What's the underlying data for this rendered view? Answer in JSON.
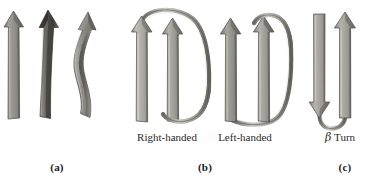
{
  "figure": {
    "background_color": "#ffffff",
    "ink_color": "#1b1b1b"
  },
  "panels": [
    {
      "id": "a",
      "caption": "(a)",
      "caption_x": 57,
      "caption_y": 162,
      "description": "Three beta-strand arrows showing increasing right-handed twist",
      "sub_caption": "",
      "arrows": [
        {
          "name": "flat-strand-arrow",
          "twist": "none",
          "direction": "up",
          "shade": "#8e8d8b"
        },
        {
          "name": "slightly-twisted-strand-arrow",
          "twist": "slight",
          "direction": "up",
          "shade": "#6e6c6a"
        },
        {
          "name": "strongly-twisted-strand-arrow",
          "twist": "strong",
          "direction": "up",
          "shade": "#9a9896"
        }
      ]
    },
    {
      "id": "b",
      "caption": "(b)",
      "caption_x": 205,
      "caption_y": 162,
      "description": "Crossover connections between parallel beta strands",
      "sub_labels": [
        {
          "name": "right-handed-label",
          "text": "Right-handed",
          "x": 166,
          "y": 137
        },
        {
          "name": "left-handed-label",
          "text": "Left-handed",
          "x": 244,
          "y": 137
        }
      ],
      "arrows": [
        {
          "name": "right-handed-strand-1",
          "direction": "up",
          "shade": "#a5a3a0"
        },
        {
          "name": "right-handed-strand-2",
          "direction": "up",
          "shade": "#8f8d8a"
        },
        {
          "name": "left-handed-strand-1",
          "direction": "up",
          "shade": "#8a8885"
        },
        {
          "name": "left-handed-strand-2",
          "direction": "up",
          "shade": "#7e7c79"
        }
      ],
      "connections": [
        {
          "name": "right-handed-crossover-loop",
          "chirality": "right-handed"
        },
        {
          "name": "left-handed-crossover-loop",
          "chirality": "left-handed"
        }
      ]
    },
    {
      "id": "c",
      "caption": "(c)",
      "caption_x": 345,
      "caption_y": 162,
      "description": "Antiparallel hairpin connected by a tight beta turn",
      "sub_labels": [
        {
          "name": "beta-turn-label",
          "text_beta": "β",
          "text_rest": " Turn",
          "x": 340,
          "y": 137
        }
      ],
      "arrows": [
        {
          "name": "beta-turn-strand-down",
          "direction": "down",
          "shade": "#8b8986"
        },
        {
          "name": "beta-turn-strand-up",
          "direction": "up",
          "shade": "#9c9a97"
        }
      ],
      "connections": [
        {
          "name": "beta-turn-loop",
          "chirality": "hairpin"
        }
      ]
    }
  ]
}
